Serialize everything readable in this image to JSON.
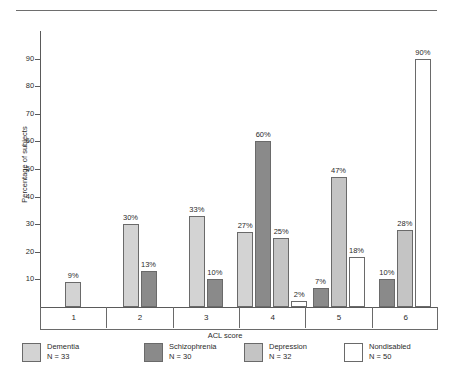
{
  "figure": {
    "top_rule": true
  },
  "chart_data": {
    "type": "bar",
    "title": "",
    "xlabel": "ACL score",
    "ylabel": "Percentage of subjects",
    "categories": [
      "1",
      "2",
      "3",
      "4",
      "5",
      "6"
    ],
    "ylim": [
      0,
      100
    ],
    "yticks": [
      10,
      20,
      30,
      40,
      50,
      60,
      70,
      80,
      90
    ],
    "ytick_labels": [
      "10",
      "20",
      "30",
      "40",
      "50",
      "60",
      "70",
      "80",
      "90"
    ],
    "grid": false,
    "legend_position": "bottom",
    "value_labels": true,
    "value_label_suffix": "%",
    "series": [
      {
        "name": "Dementia",
        "legend_label": "Dementia",
        "n_label": "N = 33",
        "n": 33,
        "color": "#d3d3d3",
        "values": [
          9,
          30,
          33,
          27,
          null,
          null
        ]
      },
      {
        "name": "Schizophrenia",
        "legend_label": "Schizophrenia",
        "n_label": "N = 30",
        "n": 30,
        "color": "#8a8a8a",
        "values": [
          null,
          13,
          10,
          60,
          7,
          10
        ]
      },
      {
        "name": "Depression",
        "legend_label": "Depression",
        "n_label": "N = 32",
        "n": 32,
        "color": "#c4c4c4",
        "values": [
          null,
          null,
          null,
          25,
          47,
          28
        ]
      },
      {
        "name": "Nondisabled",
        "legend_label": "Nondisabled",
        "n_label": "N = 50",
        "n": 50,
        "color": "#ffffff",
        "values": [
          null,
          null,
          null,
          2,
          18,
          90
        ]
      }
    ]
  },
  "axis": {
    "ylabel": "Percentage of subjects",
    "xlabel": "ACL score"
  },
  "colors": {
    "axis": "#5a5a5a",
    "bar_border": "#6a6a6a",
    "text": "#2b2b2b",
    "rule": "#6e6e6e",
    "background": "#ffffff"
  }
}
